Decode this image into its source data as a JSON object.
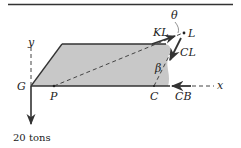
{
  "diagram": {
    "type": "free-body diagram",
    "colors": {
      "fill": "#c8c8c8",
      "stroke": "#333333",
      "line": "#444444"
    },
    "labels": {
      "G": "G",
      "P": "P",
      "C": "C",
      "L": "L",
      "x": "x",
      "y": "y",
      "theta": "θ",
      "beta": "β",
      "KL": "KL",
      "CL": "CL",
      "CB": "CB",
      "load": "20 tons"
    }
  }
}
